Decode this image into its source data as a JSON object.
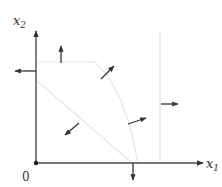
{
  "diagram": {
    "type": "feasible-region-vector-field",
    "colors": {
      "axis": "#4a4a4a",
      "arrow": "#333333",
      "boundary": "#e6e6e6",
      "background": "#ffffff"
    },
    "origin": {
      "x": 36,
      "y": 163
    },
    "labels": {
      "x_axis": "x",
      "x_axis_sub": "1",
      "y_axis": "x",
      "y_axis_sub": "2",
      "origin": "0"
    },
    "axes": {
      "x_axis": {
        "x1": 36,
        "y1": 163,
        "x2": 203,
        "y2": 163
      },
      "y_axis": {
        "x1": 36,
        "y1": 163,
        "x2": 36,
        "y2": 31
      }
    },
    "boundaries": [
      {
        "name": "top-constraint-curve",
        "points": "36,62 95,62 108,76 120,98 130,126 138,163"
      },
      {
        "name": "vertical-constraint",
        "points": "160,32 160,163"
      },
      {
        "name": "diagonal-constraint",
        "points": "36,80 132,163"
      }
    ],
    "arrows": [
      {
        "name": "arrow-up",
        "x1": 61,
        "y1": 63,
        "x2": 61,
        "y2": 46
      },
      {
        "name": "arrow-left",
        "x1": 36,
        "y1": 71,
        "x2": 15,
        "y2": 71
      },
      {
        "name": "arrow-northeast-top",
        "x1": 101,
        "y1": 79,
        "x2": 114,
        "y2": 66
      },
      {
        "name": "arrow-southwest",
        "x1": 79,
        "y1": 123,
        "x2": 65,
        "y2": 135
      },
      {
        "name": "arrow-east-northeast",
        "x1": 128,
        "y1": 124,
        "x2": 146,
        "y2": 118
      },
      {
        "name": "arrow-right",
        "x1": 161,
        "y1": 104,
        "x2": 178,
        "y2": 104
      },
      {
        "name": "arrow-down",
        "x1": 133,
        "y1": 163,
        "x2": 133,
        "y2": 180
      }
    ]
  }
}
